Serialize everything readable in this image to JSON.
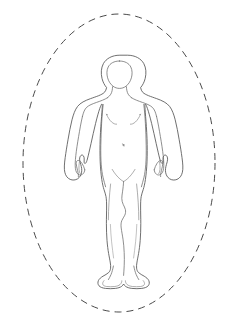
{
  "diagram": {
    "view": "anterior",
    "background_color": "#ffffff",
    "boundary": {
      "shape": "ellipse",
      "style": "dashed",
      "color": "#4a4a4a",
      "center_x": 119,
      "center_y": 163,
      "radius_x": 96,
      "radius_y": 149,
      "dash_pattern": "7 5",
      "stroke_width": 1
    },
    "figure": {
      "outline_color": "#555555",
      "inner_color": "#6a6a6a",
      "detail_color": "#8a8a8a",
      "fill_color": "#ffffff",
      "stroke_width": 0.85,
      "bounds": {
        "left": 63,
        "top": 55,
        "right": 176,
        "bottom": 290
      }
    },
    "parts": [
      {
        "name": "head",
        "label": "Head"
      },
      {
        "name": "hair-outline",
        "label": "Hair outline"
      },
      {
        "name": "neck",
        "label": "Neck"
      },
      {
        "name": "left-shoulder",
        "label": "Left shoulder"
      },
      {
        "name": "right-shoulder",
        "label": "Right shoulder"
      },
      {
        "name": "torso",
        "label": "Torso"
      },
      {
        "name": "left-arm",
        "label": "Left arm"
      },
      {
        "name": "right-arm",
        "label": "Right arm"
      },
      {
        "name": "left-hand",
        "label": "Left hand"
      },
      {
        "name": "right-hand",
        "label": "Right hand"
      },
      {
        "name": "chest-lines",
        "label": "Chest contour"
      },
      {
        "name": "navel",
        "label": "Navel"
      },
      {
        "name": "groin",
        "label": "Groin"
      },
      {
        "name": "left-leg",
        "label": "Left leg"
      },
      {
        "name": "right-leg",
        "label": "Right leg"
      },
      {
        "name": "left-foot",
        "label": "Left foot"
      },
      {
        "name": "right-foot",
        "label": "Right foot"
      }
    ]
  }
}
